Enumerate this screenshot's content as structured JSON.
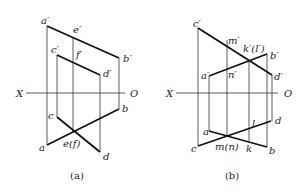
{
  "figure": {
    "panels": [
      {
        "id": "a",
        "caption": "(a)",
        "axis": {
          "left_label": "X",
          "right_label": "O",
          "x1": 26,
          "x2": 125,
          "y": 93,
          "left_x": 16,
          "right_x": 130
        },
        "front_view_lines": [
          {
            "name": "line-a-prime-b-prime",
            "x1": 47,
            "y1": 26,
            "x2": 119,
            "y2": 58
          },
          {
            "name": "line-c-prime-d-prime",
            "x1": 57,
            "y1": 55,
            "x2": 100,
            "y2": 75
          }
        ],
        "top_view_lines": [
          {
            "name": "line-a-b",
            "x1": 47,
            "y1": 145,
            "x2": 119,
            "y2": 109
          },
          {
            "name": "line-c-d",
            "x1": 57,
            "y1": 117,
            "x2": 100,
            "y2": 152
          }
        ],
        "projection_lines": [
          {
            "name": "proj-a",
            "x1": 47,
            "y1": 26,
            "x2": 47,
            "y2": 145
          },
          {
            "name": "proj-b",
            "x1": 119,
            "y1": 58,
            "x2": 119,
            "y2": 109
          },
          {
            "name": "proj-c",
            "x1": 57,
            "y1": 55,
            "x2": 57,
            "y2": 117
          },
          {
            "name": "proj-d",
            "x1": 100,
            "y1": 75,
            "x2": 100,
            "y2": 152
          },
          {
            "name": "proj-e-f",
            "x1": 73,
            "y1": 37,
            "x2": 73,
            "y2": 132
          }
        ],
        "labels": [
          {
            "text": "a′",
            "x": 41,
            "y": 24
          },
          {
            "text": "e′",
            "x": 73,
            "y": 33
          },
          {
            "text": "b′",
            "x": 123,
            "y": 62
          },
          {
            "text": "c′",
            "x": 51,
            "y": 53
          },
          {
            "text": "f′",
            "x": 76,
            "y": 58
          },
          {
            "text": "d′",
            "x": 103,
            "y": 77
          },
          {
            "text": "c",
            "x": 48,
            "y": 119
          },
          {
            "text": "b",
            "x": 122,
            "y": 112
          },
          {
            "text": "a",
            "x": 39,
            "y": 151
          },
          {
            "text": "e(f)",
            "x": 63,
            "y": 147
          },
          {
            "text": "d",
            "x": 103,
            "y": 160
          }
        ]
      },
      {
        "id": "b",
        "caption": "(b)",
        "axis": {
          "left_label": "X",
          "right_label": "O",
          "x1": 176,
          "x2": 278,
          "y": 93,
          "left_x": 166,
          "right_x": 284
        },
        "front_view_lines": [
          {
            "name": "line-c-prime-d-prime",
            "x1": 198,
            "y1": 28,
            "x2": 272,
            "y2": 75
          },
          {
            "name": "line-a-prime-b-prime",
            "x1": 209,
            "y1": 76,
            "x2": 267,
            "y2": 54
          }
        ],
        "top_view_lines": [
          {
            "name": "line-c-d",
            "x1": 198,
            "y1": 146,
            "x2": 271,
            "y2": 121
          },
          {
            "name": "line-a-b",
            "x1": 209,
            "y1": 131,
            "x2": 267,
            "y2": 147
          }
        ],
        "projection_lines": [
          {
            "name": "proj-c",
            "x1": 198,
            "y1": 28,
            "x2": 198,
            "y2": 146
          },
          {
            "name": "proj-a",
            "x1": 209,
            "y1": 76,
            "x2": 209,
            "y2": 131
          },
          {
            "name": "proj-m-n",
            "x1": 227,
            "y1": 40,
            "x2": 227,
            "y2": 136
          },
          {
            "name": "proj-k-l",
            "x1": 249,
            "y1": 61,
            "x2": 249,
            "y2": 141
          },
          {
            "name": "proj-b",
            "x1": 267,
            "y1": 54,
            "x2": 267,
            "y2": 147
          },
          {
            "name": "proj-d",
            "x1": 272,
            "y1": 75,
            "x2": 272,
            "y2": 121
          }
        ],
        "labels": [
          {
            "text": "c′",
            "x": 193,
            "y": 27
          },
          {
            "text": "m′",
            "x": 228,
            "y": 44
          },
          {
            "text": "k′(l′)",
            "x": 243,
            "y": 52
          },
          {
            "text": "b′",
            "x": 270,
            "y": 59
          },
          {
            "text": "a′",
            "x": 201,
            "y": 79
          },
          {
            "text": "n′",
            "x": 228,
            "y": 78
          },
          {
            "text": "d′",
            "x": 274,
            "y": 80
          },
          {
            "text": "l",
            "x": 252,
            "y": 127
          },
          {
            "text": "d",
            "x": 275,
            "y": 124
          },
          {
            "text": "a",
            "x": 203,
            "y": 135
          },
          {
            "text": "c",
            "x": 191,
            "y": 152
          },
          {
            "text": "m(n)",
            "x": 215,
            "y": 150
          },
          {
            "text": "k",
            "x": 246,
            "y": 152
          },
          {
            "text": "b",
            "x": 269,
            "y": 154
          }
        ]
      }
    ],
    "captions": [
      {
        "text": "(a)",
        "x": 77,
        "y": 179
      },
      {
        "text": "(b)",
        "x": 232,
        "y": 179
      }
    ]
  }
}
